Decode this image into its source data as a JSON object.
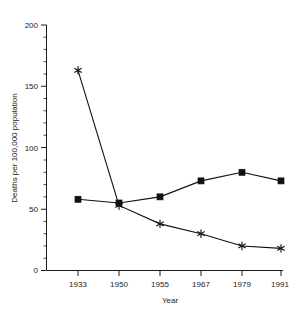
{
  "chart_data": {
    "type": "line",
    "title": "",
    "xlabel": "Year",
    "ylabel": "Deaths per 100,000 population",
    "categories": [
      "1933",
      "1950",
      "1955",
      "1967",
      "1979",
      "1991"
    ],
    "x_tick_labels": [
      "1933",
      "1950",
      "1955",
      "1967",
      "1979",
      "1991"
    ],
    "y_tick_labels": [
      "0",
      "50",
      "100",
      "150",
      "200"
    ],
    "y_ticks": [
      0,
      50,
      100,
      150,
      200
    ],
    "y_minor_tick_step": 10,
    "ylim": [
      0,
      200
    ],
    "grid": false,
    "legend": "none",
    "series": [
      {
        "name": "square-series",
        "marker": "square",
        "color": "#111111",
        "values": [
          58,
          55,
          60,
          73,
          80,
          73
        ]
      },
      {
        "name": "asterisk-series",
        "marker": "asterisk",
        "color": "#111111",
        "values": [
          163,
          53,
          38,
          30,
          20,
          18
        ]
      }
    ]
  },
  "axis": {
    "y_title": "Deaths per 100,000 population",
    "x_title": "Year",
    "y_labels": {
      "0": "0",
      "1": "50",
      "2": "100",
      "3": "150",
      "4": "200"
    },
    "x_labels": {
      "0": "1933",
      "1": "1950",
      "2": "1955",
      "3": "1967",
      "4": "1979",
      "5": "1991"
    }
  }
}
